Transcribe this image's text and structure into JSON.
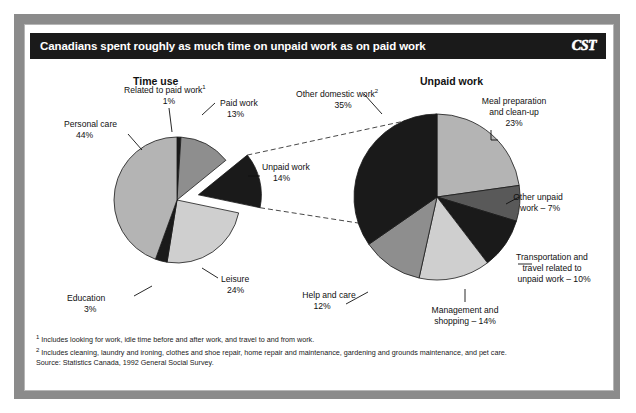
{
  "window": {
    "title": "Canadians spent roughly as much time on unpaid work as on paid work",
    "brand": "CST"
  },
  "headings": {
    "left": "Time use",
    "right": "Unpaid work"
  },
  "labels": {
    "personal_care_name": "Personal care",
    "personal_care_value": "44%",
    "related_paid_name": "Related to paid work",
    "related_paid_sup": "1",
    "related_paid_value": "1%",
    "paid_work_name": "Paid work",
    "paid_work_value": "13%",
    "unpaid_work_name": "Unpaid work",
    "unpaid_work_value": "14%",
    "leisure_name": "Leisure",
    "leisure_value": "24%",
    "education_name": "Education",
    "education_value": "3%",
    "other_domestic_name": "Other domestic work",
    "other_domestic_sup": "2",
    "other_domestic_value": "35%",
    "meal_prep_line1": "Meal preparation",
    "meal_prep_line2": "and clean-up",
    "meal_prep_value": "23%",
    "other_unpaid_line1": "Other unpaid",
    "other_unpaid_line2": "work – 7%",
    "transport_line1": "Transportation and",
    "transport_line2": "travel related to",
    "transport_line3": "unpaid work – 10%",
    "mgmt_line1": "Management and",
    "mgmt_line2": "shopping – 14%",
    "help_care_name": "Help and care",
    "help_care_value": "12%"
  },
  "footnotes": {
    "note1_marker": "1",
    "note1": " Includes looking for work, idle time before and after work, and travel to and from work.",
    "note2_marker": "2",
    "note2": " Includes cleaning, laundry and ironing, clothes and shoe repair, home repair and maintenance, gardening and grounds maintenance, and pet care.",
    "source": "Source: Statistics Canada, 1992 General Social Survey."
  },
  "colors": {
    "black": "#1a1a1a",
    "dark_gray": "#595959",
    "mid_gray": "#8e8e8e",
    "light_gray": "#b4b4b4",
    "pale_gray": "#cfcfcf",
    "frame_gray": "#8b8b8b",
    "white": "#ffffff"
  },
  "chart_data": [
    {
      "type": "pie",
      "title": "Time use",
      "id": "time-use",
      "center": [
        153,
        176
      ],
      "radius": 63,
      "start_angle": -90,
      "categories": [
        "Related to paid work",
        "Paid work",
        "Unpaid work",
        "Leisure",
        "Education",
        "Personal care"
      ],
      "values": [
        1,
        13,
        14,
        24,
        3,
        44
      ],
      "value_labels": [
        "1%",
        "13%",
        "14%",
        "24%",
        "3%",
        "44%"
      ],
      "slice_colors": [
        "#1a1a1a",
        "#8e8e8e",
        "#1a1a1a",
        "#cfcfcf",
        "#1a1a1a",
        "#b4b4b4"
      ],
      "exploded": [
        "Unpaid work"
      ],
      "explode_offset": 22,
      "legend": "labels-with-leader-lines",
      "grid": false
    },
    {
      "type": "pie",
      "title": "Unpaid work",
      "id": "unpaid-work",
      "center": [
        413,
        173
      ],
      "radius": 83,
      "start_angle": -90,
      "categories": [
        "Meal preparation and clean-up",
        "Other unpaid work",
        "Transportation and travel related to unpaid work",
        "Management and shopping",
        "Help and care",
        "Other domestic work"
      ],
      "values": [
        23,
        7,
        10,
        14,
        12,
        35
      ],
      "value_labels": [
        "23%",
        "7%",
        "10%",
        "14%",
        "12%",
        "35%"
      ],
      "slice_colors": [
        "#b4b4b4",
        "#595959",
        "#1a1a1a",
        "#cfcfcf",
        "#8e8e8e",
        "#1a1a1a"
      ],
      "exploded": [],
      "legend": "labels-with-leader-lines",
      "grid": false
    }
  ]
}
